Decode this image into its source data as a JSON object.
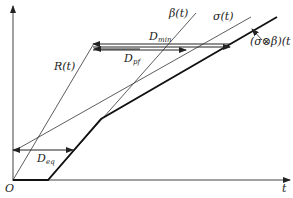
{
  "diagram": {
    "type": "network-calculus-delay-bounds",
    "axes": {
      "x_label": "t",
      "origin_label": "O"
    },
    "curves": [
      {
        "name": "R(t)",
        "label": "R(t)"
      },
      {
        "name": "beta",
        "label": "β(t)"
      },
      {
        "name": "sigma",
        "label": "σ(t)"
      },
      {
        "name": "convolution",
        "label": "(σ⊗β)(t"
      }
    ],
    "delays": [
      {
        "name": "D_min",
        "label_main": "D",
        "label_sub": "min"
      },
      {
        "name": "D_pf",
        "label_main": "D",
        "label_sub": "pf"
      },
      {
        "name": "D_eq",
        "label_main": "D",
        "label_sub": "eq"
      }
    ],
    "colors": {
      "stroke": "#222222",
      "background": "#ffffff"
    }
  }
}
